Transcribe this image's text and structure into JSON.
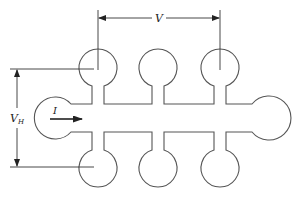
{
  "diagram": {
    "type": "hall-bar-sample",
    "labels": {
      "v": "V",
      "vh_main": "V",
      "vh_sub": "H",
      "current": "I"
    },
    "colors": {
      "outline": "#555555",
      "dimension": "#333333",
      "text": "#222222",
      "background": "#ffffff"
    },
    "contacts": {
      "top": [
        {
          "cx": 98,
          "cy": 69,
          "r": 19
        },
        {
          "cx": 158,
          "cy": 69,
          "r": 19
        },
        {
          "cx": 220,
          "cy": 69,
          "r": 19
        }
      ],
      "bottom": [
        {
          "cx": 98,
          "cy": 167,
          "r": 19
        },
        {
          "cx": 158,
          "cy": 167,
          "r": 19
        },
        {
          "cx": 220,
          "cy": 167,
          "r": 19
        }
      ],
      "left_pad": {
        "cx": 53,
        "cy": 118,
        "r": 21
      },
      "right_pad": {
        "cx": 271,
        "cy": 118,
        "r": 22
      }
    },
    "dimensions": {
      "v_span": {
        "x1": 98,
        "x2": 220,
        "y": 18
      },
      "vh_span": {
        "x": 17,
        "y1": 69,
        "y2": 167
      }
    }
  }
}
